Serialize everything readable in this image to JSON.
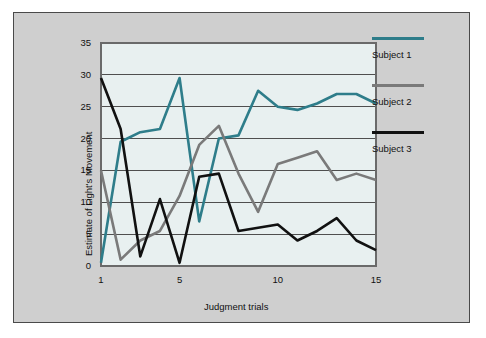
{
  "chart_data": {
    "type": "line",
    "title": "",
    "xlabel": "Judgment trials",
    "ylabel": "Estimate of Light's Movement",
    "xlim": [
      1,
      15
    ],
    "ylim": [
      0,
      35
    ],
    "xticks": [
      1,
      5,
      10,
      15
    ],
    "yticks": [
      0,
      5,
      10,
      15,
      20,
      25,
      30,
      35
    ],
    "grid": true,
    "legend_position": "right",
    "x": [
      1,
      2,
      3,
      4,
      5,
      6,
      7,
      8,
      9,
      10,
      11,
      12,
      13,
      14,
      15
    ],
    "series": [
      {
        "name": "Subject 1",
        "color": "#2e7d8a",
        "values": [
          0.5,
          19.5,
          21,
          21.5,
          29.5,
          7,
          20,
          20.5,
          27.5,
          25,
          24.5,
          25.5,
          27,
          27,
          25.5
        ]
      },
      {
        "name": "Subject 2",
        "color": "#7a7a7a",
        "values": [
          15,
          1,
          4,
          5.5,
          11,
          19,
          22,
          14.5,
          8.5,
          16,
          17,
          18,
          13.5,
          14.5,
          13.5
        ]
      },
      {
        "name": "Subject 3",
        "color": "#111111",
        "values": [
          29.5,
          21.5,
          1.5,
          10.5,
          0.5,
          14,
          14.5,
          5.5,
          6,
          6.5,
          4,
          5.5,
          7.5,
          4,
          2.5
        ]
      }
    ]
  },
  "legend": {
    "entries": [
      {
        "label": "Subject 1",
        "color": "#2e7d8a"
      },
      {
        "label": "Subject 2",
        "color": "#7a7a7a"
      },
      {
        "label": "Subject 3",
        "color": "#111111"
      }
    ]
  },
  "axes": {
    "y_tick_labels": [
      "35",
      "30",
      "25",
      "20",
      "15",
      "10",
      "5",
      "0"
    ],
    "x_tick_labels": [
      "1",
      "5",
      "10",
      "15"
    ],
    "y_title": "Estimate of Light's Movement",
    "x_title": "Judgment trials"
  },
  "colors": {
    "page_background": "#ffffff",
    "frame_background": "#cfcfcf",
    "plot_background": "#e8f0f0",
    "grid_line": "#4f4f4f",
    "axis_line": "#6a6a6a",
    "text": "#111111"
  }
}
